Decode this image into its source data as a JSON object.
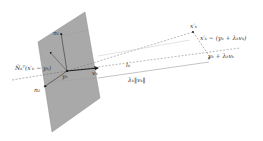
{
  "diagram": {
    "colors": {
      "plane_fill": "#a9a9a9",
      "plane_stroke": "#8c8c8c",
      "line": "#555555",
      "arrow": "#222222"
    },
    "labels": {
      "normal_1": "n₁",
      "normal_2": "n₂",
      "projection": "N̂ₖᵀ(x′ₖ − yₖ)",
      "origin": "yₖ",
      "direction": "vₖ",
      "target_point": "x′ₖ",
      "residual": "x′ₖ − (yₖ + λₖvₖ)",
      "line_point": "yₖ + λₖvₖ",
      "line": "lₖ",
      "distance": "λₖ‖vₖ‖"
    }
  }
}
